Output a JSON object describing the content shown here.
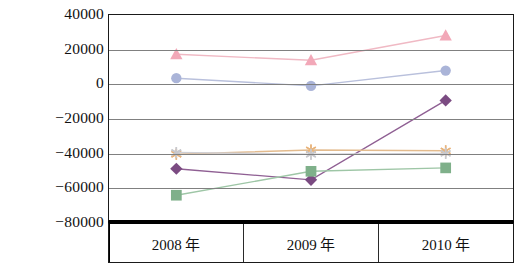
{
  "chart_data": {
    "type": "line",
    "title": "",
    "xlabel": "",
    "ylabel": "",
    "categories": [
      "2008 年",
      "2009 年",
      "2010 年"
    ],
    "ylim": [
      -80000,
      40000
    ],
    "yticks": [
      40000,
      20000,
      0,
      -20000,
      -40000,
      -60000,
      -80000
    ],
    "ytick_labels": [
      "40000",
      "20000",
      "0",
      "−20000",
      "−40000",
      "−60000",
      "−80000"
    ],
    "grid": true,
    "legend": "none",
    "series": [
      {
        "name": "series-triangle-pink",
        "marker": "triangle",
        "color": "#f2a8b8",
        "line_color": "#f0b9c4",
        "values": [
          17000,
          13500,
          28000
        ]
      },
      {
        "name": "series-circle-blue",
        "marker": "circle",
        "color": "#aab4d8",
        "line_color": "#b9c0dc",
        "values": [
          3000,
          -1500,
          7500
        ]
      },
      {
        "name": "series-diamond-purple",
        "marker": "diamond",
        "color": "#7b4b82",
        "line_color": "#8f5f93",
        "values": [
          -50000,
          -56500,
          -10000
        ]
      },
      {
        "name": "series-square-green",
        "marker": "square",
        "color": "#7fb08a",
        "line_color": "#9ec6a6",
        "values": [
          -65500,
          -51500,
          -49500
        ]
      },
      {
        "name": "series-star-orange",
        "marker": "star",
        "color": "#e8b37a",
        "line_color": "#e3bb8e",
        "values": [
          -41500,
          -39000,
          -39500
        ]
      },
      {
        "name": "series-star-gray",
        "marker": "star",
        "color": "#c8c8cc",
        "line_color": "#cfcfd4",
        "values": [
          -40500,
          -41500,
          -41000
        ]
      }
    ]
  },
  "colors": {
    "axis": "#1a1a1a",
    "grid": "#808080",
    "background": "#ffffff"
  }
}
